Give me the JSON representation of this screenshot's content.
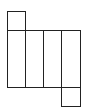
{
  "diagram": {
    "type": "net-of-rectangular-prism",
    "stroke_color": "#222222",
    "background": "#ffffff",
    "faces": [
      {
        "name": "top-flap",
        "x": 7,
        "y": 11,
        "w": 18,
        "h": 19
      },
      {
        "name": "face-1",
        "x": 7,
        "y": 30,
        "w": 18,
        "h": 57
      },
      {
        "name": "face-2",
        "x": 25,
        "y": 30,
        "w": 18,
        "h": 57
      },
      {
        "name": "face-3",
        "x": 43,
        "y": 30,
        "w": 18,
        "h": 57
      },
      {
        "name": "face-4",
        "x": 61,
        "y": 30,
        "w": 19,
        "h": 57
      },
      {
        "name": "bottom-flap",
        "x": 61,
        "y": 87,
        "w": 19,
        "h": 19
      }
    ]
  }
}
